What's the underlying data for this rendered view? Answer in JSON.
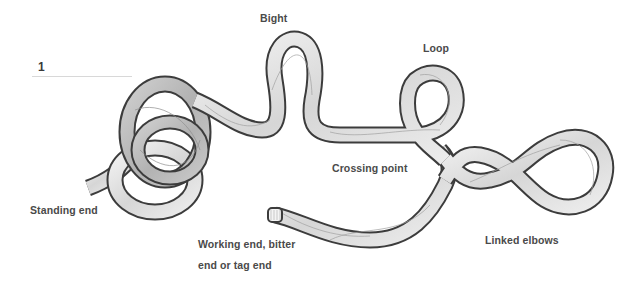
{
  "figure": {
    "number": "1",
    "rope_colors": {
      "outline": "#3c3c3c",
      "fill_light": "#f2f2f2",
      "fill_mid": "#d9d9d9",
      "fill_dark": "#bdbdbd",
      "strand": "#9a9a9a"
    }
  },
  "labels": {
    "bight": "Bight",
    "loop": "Loop",
    "crossing_point": "Crossing point",
    "standing_end": "Standing end",
    "working_end_line1": "Working end, bitter",
    "working_end_line2": "end or tag end",
    "linked_elbows": "Linked elbows"
  }
}
